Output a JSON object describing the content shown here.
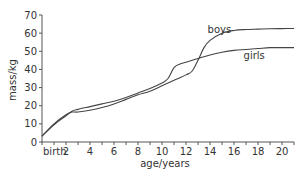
{
  "chart_data": {
    "type": "line",
    "title": "",
    "xlabel": "age/years",
    "ylabel": "mass/kg",
    "xlim": [
      0,
      21
    ],
    "ylim": [
      0,
      70
    ],
    "x_ticks": [
      0,
      2,
      4,
      6,
      8,
      10,
      12,
      14,
      16,
      18,
      20
    ],
    "x_tick_labels": [
      "birth",
      "2",
      "4",
      "6",
      "8",
      "10",
      "12",
      "14",
      "16",
      "18",
      "20"
    ],
    "y_ticks": [
      0,
      10,
      20,
      30,
      40,
      50,
      60,
      70
    ],
    "y_tick_labels": [
      "0",
      "10",
      "20",
      "30",
      "40",
      "50",
      "60",
      "70"
    ],
    "grid": false,
    "legend": "inline labels",
    "series": [
      {
        "name": "boys",
        "label_pos": [
          13.8,
          60
        ],
        "x": [
          0,
          1,
          2,
          2.5,
          3,
          4,
          5,
          6,
          7,
          8,
          9,
          10,
          11,
          12,
          12.5,
          13,
          13.5,
          14,
          15,
          16,
          17,
          18,
          19,
          20,
          21
        ],
        "values": [
          3.3,
          10,
          15,
          16.5,
          16.5,
          17.5,
          19,
          21,
          23.5,
          26,
          28,
          31,
          34,
          37,
          39,
          45,
          52,
          56,
          60,
          61.5,
          62,
          62.2,
          62.4,
          62.5,
          62.6
        ]
      },
      {
        "name": "girls",
        "label_pos": [
          16.8,
          46
        ],
        "x": [
          0,
          1,
          2,
          2.5,
          3,
          4,
          5,
          6,
          7,
          8,
          9,
          10,
          10.5,
          11,
          11.5,
          12,
          13,
          14,
          15,
          16,
          17,
          18,
          19,
          20,
          21
        ],
        "values": [
          3.2,
          9.5,
          14.5,
          17,
          18,
          19.5,
          21,
          22.5,
          24.5,
          27,
          29.5,
          32.5,
          35,
          41,
          43,
          44,
          46,
          48,
          49.5,
          50.5,
          51,
          51.5,
          52,
          52,
          52
        ]
      }
    ]
  },
  "labels": {
    "xlabel": "age/years",
    "ylabel": "mass/kg",
    "boys": "boys",
    "girls": "girls"
  },
  "colors": {
    "axis": "#555555",
    "line": "#444444",
    "text": "#333333"
  }
}
